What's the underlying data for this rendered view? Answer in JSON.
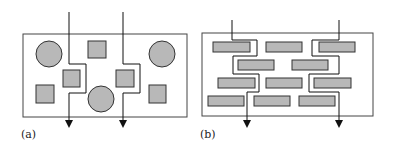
{
  "panels": [
    {
      "label": "(a)",
      "description": "Tortuous diffusion paths around scattered particles (circles and squares)"
    },
    {
      "label": "(b)",
      "description": "Tortuous diffusion paths around layered platelets (brick arrangement)"
    }
  ],
  "colors": {
    "fill": "#b8b8b8",
    "stroke": "#333333",
    "line": "#111111"
  }
}
